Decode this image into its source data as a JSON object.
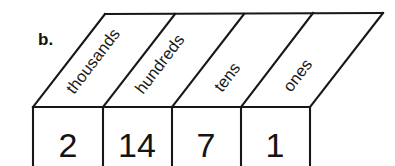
{
  "figure": {
    "item_label": "b.",
    "type": "place-value-chart",
    "columns": [
      {
        "label": "thousands",
        "value": "2"
      },
      {
        "label": "hundreds",
        "value": "14"
      },
      {
        "label": "tens",
        "value": "7"
      },
      {
        "label": "ones",
        "value": "1"
      }
    ],
    "colors": {
      "line": "#171717",
      "background": "#ffffff",
      "text": "#1a1a1a"
    },
    "geometry": {
      "slant_angle_deg": -52.6,
      "top_face_top_y": 14,
      "top_face_bottom_y": 107,
      "row_left_x": 33,
      "row_right_x": 310,
      "dividers_x": [
        33,
        103,
        172,
        241,
        310
      ]
    }
  }
}
